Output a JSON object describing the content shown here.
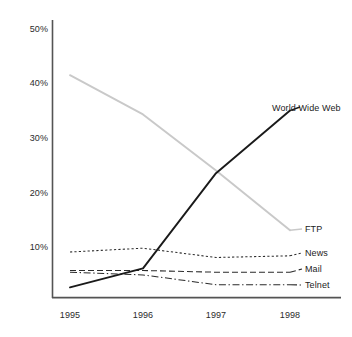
{
  "chart_data": {
    "type": "line",
    "title": "",
    "subtitle": "",
    "xlabel": "",
    "ylabel": "",
    "categories": [
      "1995",
      "1996",
      "1997",
      "1998"
    ],
    "x": [
      1995,
      1996,
      1997,
      1998
    ],
    "ylim": [
      0,
      52
    ],
    "xlim": [
      1994.8,
      1998.3
    ],
    "grid": false,
    "legend_position": "right-inline-end-of-line",
    "y_ticks": [
      {
        "value": 50,
        "label": "50%"
      },
      {
        "value": 40,
        "label": "40%"
      },
      {
        "value": 30,
        "label": "30%"
      },
      {
        "value": 20,
        "label": "20%"
      },
      {
        "value": 10,
        "label": "10%"
      }
    ],
    "x_ticks": [
      {
        "value": 1995,
        "label": "1995"
      },
      {
        "value": 1996,
        "label": "1996"
      },
      {
        "value": 1997,
        "label": "1997"
      },
      {
        "value": 1998,
        "label": "1998"
      }
    ],
    "series": [
      {
        "name": "World Wide Web",
        "label": "World Wide Web",
        "values": [
          2.5,
          6.0,
          23.5,
          35.0
        ],
        "color": "#1a1a1a",
        "style": "solid",
        "width": 1.8
      },
      {
        "name": "FTP",
        "label": "FTP",
        "values": [
          41.5,
          34.3,
          24.0,
          13.0
        ],
        "color": "#c9c9c9",
        "style": "solid",
        "width": 1.8
      },
      {
        "name": "News",
        "label": "News",
        "values": [
          9.0,
          9.7,
          8.0,
          8.3
        ],
        "color": "#2b2b2b",
        "style": "dotted",
        "width": 1.1
      },
      {
        "name": "Mail",
        "label": "Mail",
        "values": [
          5.6,
          5.6,
          5.3,
          5.3
        ],
        "color": "#2b2b2b",
        "style": "dashed",
        "width": 1.1
      },
      {
        "name": "Telnet",
        "label": "Telnet",
        "values": [
          5.3,
          4.8,
          3.0,
          3.0
        ],
        "color": "#2b2b2b",
        "style": "dashdot",
        "width": 1.1
      }
    ],
    "axis_color": "#4a4a4a",
    "background_color": "#ffffff"
  },
  "labels": {
    "y0": "50%",
    "y1": "40%",
    "y2": "30%",
    "y3": "20%",
    "y4": "10%",
    "x0": "1995",
    "x1": "1996",
    "x2": "1997",
    "x3": "1998",
    "s0": "World Wide Web",
    "s1": "FTP",
    "s2": "News",
    "s3": "Mail",
    "s4": "Telnet"
  }
}
